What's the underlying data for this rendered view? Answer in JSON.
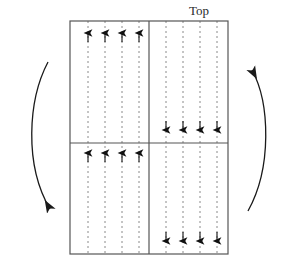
{
  "figure": {
    "title_label": "Top",
    "colors": {
      "border": "#555555",
      "divider": "#555555",
      "dashed_line": "#8a8a8a",
      "arrowhead": "#111111",
      "curved_arrow": "#1a1a1a",
      "label_text": "#2b2b2b",
      "background": "#ffffff"
    },
    "box": {
      "x": 70,
      "y": 21,
      "width": 158,
      "height": 233,
      "vertical_divider_x": 149,
      "horizontal_divider_y": 143
    },
    "dashed_lines": {
      "count_left": 4,
      "count_right": 4,
      "left_x": [
        88,
        105,
        122,
        139
      ],
      "right_x": [
        166,
        183,
        200,
        217
      ],
      "dash_pattern": "2 3"
    },
    "flow_arrows": [
      {
        "name": "upper-left-up-arrows",
        "direction": "up",
        "quadrant": "upper-left",
        "y": 34,
        "x": [
          88,
          105,
          122,
          139
        ]
      },
      {
        "name": "lower-left-up-arrows",
        "direction": "up",
        "quadrant": "lower-left",
        "y": 154,
        "x": [
          88,
          105,
          122,
          139
        ]
      },
      {
        "name": "upper-right-down-arrows",
        "direction": "down",
        "quadrant": "upper-right",
        "y": 130,
        "x": [
          166,
          183,
          200,
          217
        ]
      },
      {
        "name": "lower-right-down-arrows",
        "direction": "down",
        "quadrant": "lower-right",
        "y": 241,
        "x": [
          166,
          183,
          200,
          217
        ]
      }
    ],
    "circulation_arrows": [
      {
        "name": "left-circulation-arrow",
        "direction": "downward",
        "start": [
          48,
          62
        ],
        "end": [
          52,
          211
        ]
      },
      {
        "name": "right-circulation-arrow",
        "direction": "upward",
        "start": [
          248,
          211
        ],
        "end": [
          250,
          68
        ]
      }
    ]
  }
}
